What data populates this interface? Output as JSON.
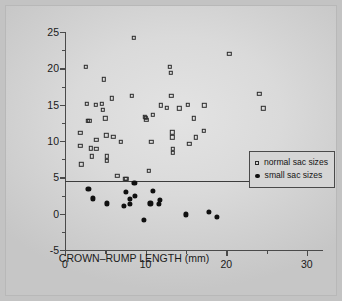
{
  "chart_data": {
    "type": "scatter",
    "title": "",
    "xlabel": "CROWN–RUMP LENGTH (mm)",
    "ylabel": "MEAN SAC SIZE MINUS CROWN–RUMP LENGTH",
    "xlim": [
      0,
      32
    ],
    "ylim": [
      -5,
      25
    ],
    "xticks": [
      0,
      10,
      20,
      30
    ],
    "yticks": [
      -5,
      0,
      5,
      10,
      15,
      20,
      25
    ],
    "xtick_labels": [
      "0",
      "10",
      "20",
      "30"
    ],
    "ytick_labels": [
      "-5",
      "0",
      "5",
      "10",
      "15",
      "20",
      "25"
    ],
    "xminor": [
      5,
      15,
      25
    ],
    "yminor": [
      -2.5,
      2.5,
      7.5,
      12.5,
      17.5,
      22.5
    ],
    "grid": false,
    "legend_position": "right-middle",
    "annotations": [
      {
        "type": "hline",
        "y": 4.5,
        "label": ""
      }
    ],
    "series": [
      {
        "name": "normal sac sizes",
        "marker": "open-square",
        "color": "#2b2b2b",
        "points": [
          [
            1.9,
            11.1
          ],
          [
            1.9,
            9.3
          ],
          [
            2.0,
            6.8
          ],
          [
            2.6,
            20.2
          ],
          [
            2.7,
            15.1
          ],
          [
            2.8,
            12.8
          ],
          [
            3.0,
            12.8
          ],
          [
            3.2,
            9.0
          ],
          [
            3.3,
            7.9
          ],
          [
            3.8,
            15.0
          ],
          [
            3.9,
            10.2
          ],
          [
            3.9,
            8.9
          ],
          [
            4.6,
            15.1
          ],
          [
            4.7,
            14.3
          ],
          [
            4.8,
            18.5
          ],
          [
            5.0,
            13.1
          ],
          [
            5.1,
            10.8
          ],
          [
            5.2,
            7.9
          ],
          [
            5.2,
            7.3
          ],
          [
            5.8,
            15.9
          ],
          [
            6.0,
            10.6
          ],
          [
            6.5,
            5.2
          ],
          [
            6.9,
            9.9
          ],
          [
            7.5,
            4.8
          ],
          [
            7.6,
            4.8
          ],
          [
            8.3,
            16.2
          ],
          [
            8.5,
            24.2
          ],
          [
            9.9,
            13.3
          ],
          [
            10.0,
            13.2
          ],
          [
            10.1,
            12.9
          ],
          [
            10.4,
            5.9
          ],
          [
            10.7,
            9.9
          ],
          [
            10.9,
            13.6
          ],
          [
            11.9,
            14.9
          ],
          [
            13.0,
            20.2
          ],
          [
            13.1,
            19.4
          ],
          [
            13.2,
            16.2
          ],
          [
            13.3,
            11.2
          ],
          [
            13.3,
            10.5
          ],
          [
            13.4,
            8.9
          ],
          [
            13.4,
            8.4
          ],
          [
            12.6,
            14.6
          ],
          [
            14.2,
            14.5
          ],
          [
            15.2,
            15.0
          ],
          [
            15.4,
            9.6
          ],
          [
            16.0,
            13.1
          ],
          [
            16.2,
            10.5
          ],
          [
            17.2,
            11.4
          ],
          [
            17.3,
            14.9
          ],
          [
            20.4,
            22.0
          ],
          [
            24.1,
            16.5
          ],
          [
            24.6,
            14.5
          ]
        ]
      },
      {
        "name": "small sac sizes",
        "marker": "filled-circle",
        "color": "#101010",
        "points": [
          [
            2.9,
            3.4
          ],
          [
            3.5,
            2.1
          ],
          [
            5.2,
            1.4
          ],
          [
            7.3,
            1.1
          ],
          [
            7.6,
            3.0
          ],
          [
            8.0,
            2.0
          ],
          [
            8.0,
            1.3
          ],
          [
            8.6,
            4.2
          ],
          [
            8.7,
            2.4
          ],
          [
            9.8,
            -0.9
          ],
          [
            10.6,
            1.4
          ],
          [
            10.9,
            3.1
          ],
          [
            11.6,
            1.3
          ],
          [
            11.8,
            1.9
          ],
          [
            15.0,
            -0.1
          ],
          [
            17.8,
            0.2
          ],
          [
            18.8,
            -0.4
          ]
        ]
      }
    ],
    "legend": [
      {
        "label": "normal sac sizes",
        "marker": "open-square"
      },
      {
        "label": "small sac sizes",
        "marker": "filled-circle"
      }
    ]
  }
}
